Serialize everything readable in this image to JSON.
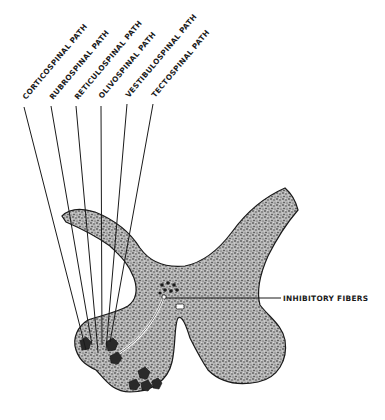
{
  "figure": {
    "tract_labels": [
      {
        "id": "corticospinal",
        "text": "CORTICOSPINAL PATH"
      },
      {
        "id": "rubrospinal",
        "text": "RUBROSPINAL PATH"
      },
      {
        "id": "reticulospinal",
        "text": "RETICULOSPINAL PATH"
      },
      {
        "id": "olivospinal",
        "text": "OLIVOSPINAL PATH"
      },
      {
        "id": "vestibulospinal",
        "text": "VESTIBULOSPINAL PATH"
      },
      {
        "id": "tectospinal",
        "text": "TECTOSPINAL PATH"
      }
    ],
    "side_label": {
      "id": "inhibitory-fibers",
      "text": "INHIBITORY FIBERS"
    },
    "colors": {
      "ink": "#1a1a1a",
      "background": "#ffffff",
      "gray_matter": "#8a8a8a"
    }
  }
}
